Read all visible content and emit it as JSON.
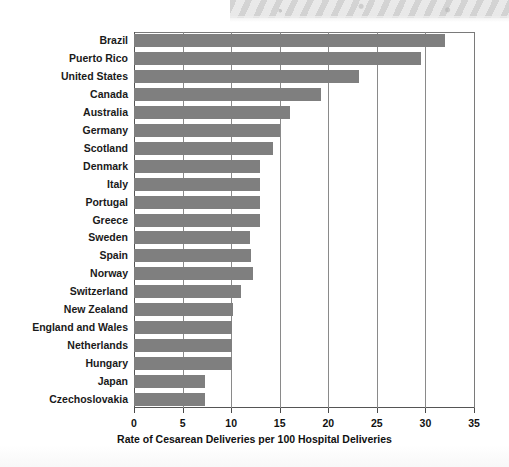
{
  "chart_data": {
    "type": "bar",
    "orientation": "horizontal",
    "title": "",
    "subtitle": "",
    "xlabel": "Rate of Cesarean Deliveries per 100 Hospital Deliveries",
    "ylabel": "",
    "xlim": [
      0,
      35
    ],
    "xticks": [
      0,
      5,
      10,
      15,
      20,
      25,
      30,
      35
    ],
    "xtick_labels": [
      "0",
      "5",
      "10",
      "15",
      "20",
      "25",
      "30",
      "35"
    ],
    "grid": "vertical",
    "legend": "none",
    "bar_color": "#7f7f7f",
    "categories": [
      "Brazil",
      "Puerto Rico",
      "United States",
      "Canada",
      "Australia",
      "Germany",
      "Scotland",
      "Denmark",
      "Italy",
      "Portugal",
      "Greece",
      "Sweden",
      "Spain",
      "Norway",
      "Switzerland",
      "New Zealand",
      "England and Wales",
      "Netherlands",
      "Hungary",
      "Japan",
      "Czechoslovakia"
    ],
    "values": [
      32.0,
      29.5,
      23.2,
      19.3,
      16.1,
      15.0,
      14.3,
      13.0,
      13.0,
      13.0,
      13.0,
      11.9,
      12.0,
      12.2,
      11.0,
      10.2,
      10.1,
      10.1,
      10.1,
      7.3,
      7.3
    ]
  }
}
